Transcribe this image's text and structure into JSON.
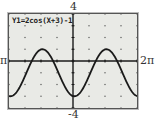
{
  "chart_data": {
    "type": "line",
    "title": "Y1=2cos(X+3)-1",
    "function": "2*cos(x+3)-1",
    "xlim": [
      -6.2832,
      6.2832
    ],
    "ylim": [
      -4,
      4
    ],
    "x_tick_labels": {
      "min": "-2π",
      "max": "2π"
    },
    "y_tick_labels": {
      "min": "-4",
      "max": "4"
    },
    "x_scale": 1.5708,
    "y_scale": 1,
    "grid": "dots",
    "series": [
      {
        "name": "Y1",
        "x": [
          -6.28,
          -5.5,
          -4.71,
          -3.93,
          -3.14,
          -2.36,
          -1.57,
          -0.79,
          0,
          0.79,
          1.57,
          2.36,
          3.14,
          3.93,
          4.71,
          5.5,
          6.28
        ],
        "values": [
          -2.92,
          -1.94,
          -0.11,
          0.71,
          0.98,
          -0.06,
          -1.28,
          -2.68,
          -2.98,
          -2.23,
          -1.28,
          -0.08,
          1.0,
          0.4,
          -0.8,
          -2.4,
          -2.92
        ]
      }
    ]
  },
  "labels": {
    "top": "4",
    "bottom": "-4",
    "left": "-2π",
    "right": "2π"
  },
  "equation": "Y1=2cos(X+3)-1",
  "colors": {
    "screen": "#e9eae6",
    "curve": "#1a1a1a",
    "axis": "#1a1a1a",
    "frame": "#555555"
  }
}
